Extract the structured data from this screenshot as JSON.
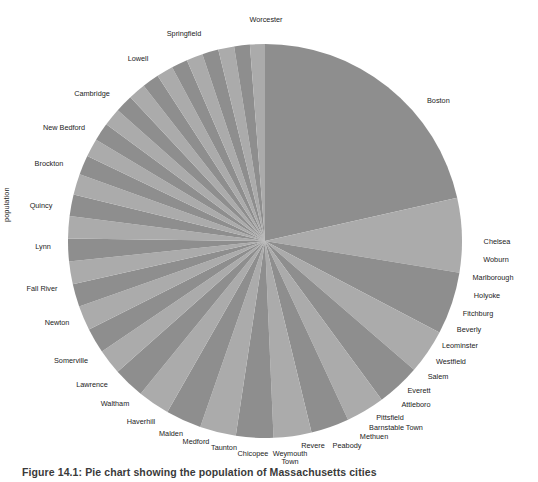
{
  "figure": {
    "caption": "Figure 14.1: Pie chart showing the population of Massachusetts cities",
    "y_axis_label": "population"
  },
  "chart_data": {
    "type": "pie",
    "title": "",
    "xlabel": "",
    "ylabel": "population",
    "legend_position": "none",
    "grid": false,
    "start_angle_deg": 90,
    "direction": "clockwise",
    "colors": {
      "dark": "#8e8e8e",
      "light": "#ababab",
      "background": "#ffffff",
      "text": "#1c1c1c"
    },
    "categories": [
      "Boston",
      "Worcester",
      "Springfield",
      "Lowell",
      "Cambridge",
      "New Bedford",
      "Brockton",
      "Quincy",
      "Lynn",
      "Fall River",
      "Newton",
      "Somerville",
      "Lawrence",
      "Waltham",
      "Haverhill",
      "Malden",
      "Medford",
      "Taunton",
      "Chicopee",
      "Weymouth Town",
      "Revere",
      "Peabody",
      "Methuen",
      "Barnstable Town",
      "Pittsfield",
      "Attleboro",
      "Everett",
      "Salem",
      "Westfield",
      "Leominster",
      "Beverly",
      "Fitchburg",
      "Holyoke",
      "Marlborough",
      "Woburn",
      "Chelsea"
    ],
    "values": [
      645966,
      183016,
      153991,
      109945,
      107289,
      95072,
      94089,
      93494,
      92076,
      88930,
      87971,
      78804,
      77657,
      62227,
      62088,
      60840,
      56173,
      55874,
      55717,
      55217,
      53157,
      51251,
      47942,
      45193,
      44737,
      44284,
      44202,
      42544,
      41552,
      41002,
      39876,
      40318,
      40135,
      39248,
      38514,
      36828
    ]
  },
  "labels": [
    {
      "name": "Boston",
      "x": 427,
      "y": 103,
      "anchor": "start"
    },
    {
      "name": "Worcester",
      "x": 266,
      "y": 22,
      "anchor": "middle"
    },
    {
      "name": "Springfield",
      "x": 184,
      "y": 36,
      "anchor": "middle"
    },
    {
      "name": "Lowell",
      "x": 138,
      "y": 61,
      "anchor": "middle"
    },
    {
      "name": "Cambridge",
      "x": 92,
      "y": 96,
      "anchor": "middle"
    },
    {
      "name": "New Bedford",
      "x": 64,
      "y": 130,
      "anchor": "middle"
    },
    {
      "name": "Brockton",
      "x": 49,
      "y": 166,
      "anchor": "middle"
    },
    {
      "name": "Quincy",
      "x": 41,
      "y": 208,
      "anchor": "middle"
    },
    {
      "name": "Lynn",
      "x": 43,
      "y": 249,
      "anchor": "middle"
    },
    {
      "name": "Fall River",
      "x": 42,
      "y": 291,
      "anchor": "middle"
    },
    {
      "name": "Newton",
      "x": 57,
      "y": 325,
      "anchor": "middle"
    },
    {
      "name": "Somerville",
      "x": 71,
      "y": 363,
      "anchor": "middle"
    },
    {
      "name": "Lawrence",
      "x": 92,
      "y": 387,
      "anchor": "middle"
    },
    {
      "name": "Waltham",
      "x": 115,
      "y": 406,
      "anchor": "middle"
    },
    {
      "name": "Haverhill",
      "x": 141,
      "y": 424,
      "anchor": "middle"
    },
    {
      "name": "Malden",
      "x": 171,
      "y": 436,
      "anchor": "middle"
    },
    {
      "name": "Medford",
      "x": 196,
      "y": 444,
      "anchor": "middle"
    },
    {
      "name": "Taunton",
      "x": 224,
      "y": 450,
      "anchor": "middle"
    },
    {
      "name": "Chicopee",
      "x": 253,
      "y": 456,
      "anchor": "middle"
    },
    {
      "name": "Weymouth",
      "x": 290,
      "y": 456,
      "anchor": "middle"
    },
    {
      "name": "Town",
      "x": 290,
      "y": 464,
      "anchor": "middle"
    },
    {
      "name": "Revere",
      "x": 313,
      "y": 448,
      "anchor": "middle"
    },
    {
      "name": "Peabody",
      "x": 347,
      "y": 448,
      "anchor": "middle"
    },
    {
      "name": "Methuen",
      "x": 374,
      "y": 439,
      "anchor": "middle"
    },
    {
      "name": "Barnstable Town",
      "x": 396,
      "y": 430,
      "anchor": "middle"
    },
    {
      "name": "Pittsfield",
      "x": 390,
      "y": 420,
      "anchor": "middle"
    },
    {
      "name": "Attleboro",
      "x": 416,
      "y": 407,
      "anchor": "middle"
    },
    {
      "name": "Everett",
      "x": 419,
      "y": 393,
      "anchor": "middle"
    },
    {
      "name": "Salem",
      "x": 438,
      "y": 379,
      "anchor": "middle"
    },
    {
      "name": "Westfield",
      "x": 451,
      "y": 364,
      "anchor": "middle"
    },
    {
      "name": "Leominster",
      "x": 460,
      "y": 348,
      "anchor": "middle"
    },
    {
      "name": "Beverly",
      "x": 469,
      "y": 332,
      "anchor": "middle"
    },
    {
      "name": "Fitchburg",
      "x": 478,
      "y": 316,
      "anchor": "middle"
    },
    {
      "name": "Holyoke",
      "x": 487,
      "y": 298,
      "anchor": "middle"
    },
    {
      "name": "Marlborough",
      "x": 493,
      "y": 280,
      "anchor": "middle"
    },
    {
      "name": "Woburn",
      "x": 496,
      "y": 262,
      "anchor": "middle"
    },
    {
      "name": "Chelsea",
      "x": 497,
      "y": 244,
      "anchor": "middle"
    }
  ],
  "geometry": {
    "cx": 265,
    "cy": 241,
    "r": 197
  }
}
